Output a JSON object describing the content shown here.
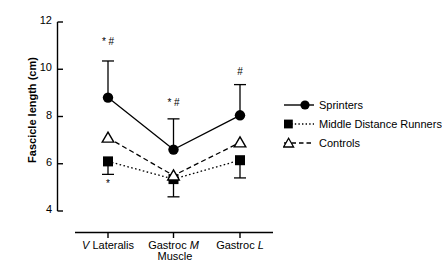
{
  "chart_data": {
    "type": "line",
    "title": "",
    "xlabel": "Muscle",
    "ylabel": "Fascicle length (cm)",
    "categories": [
      "V Lateralis",
      "Gastroc M",
      "Gastroc L"
    ],
    "category_labels_html": [
      "<em>V</em> Lateralis",
      "Gastroc <em>M</em>",
      "Gastroc <em>L</em>"
    ],
    "ylim": [
      4,
      12
    ],
    "yticks": [
      4,
      6,
      8,
      10,
      12
    ],
    "ytick_labels": [
      "4",
      "6",
      "8",
      "10",
      "12"
    ],
    "grid": false,
    "legend_position": "right",
    "series": [
      {
        "name": "Sprinters",
        "marker": "filled-circle",
        "line": "solid",
        "values": [
          8.8,
          6.6,
          8.05
        ],
        "err_upper": [
          1.55,
          1.3,
          1.3
        ],
        "err_lower": [
          0,
          0,
          0
        ]
      },
      {
        "name": "Middle Distance Runners",
        "marker": "filled-square",
        "line": "dotted",
        "values": [
          6.1,
          5.35,
          6.15
        ],
        "err_upper": [
          0,
          0,
          0
        ],
        "err_lower": [
          0.55,
          0.75,
          0.75
        ]
      },
      {
        "name": "Controls",
        "marker": "open-triangle",
        "line": "dashed",
        "values": [
          7.1,
          5.5,
          6.9
        ],
        "err_upper": [
          0,
          0,
          0
        ],
        "err_lower": [
          0,
          0,
          0
        ]
      }
    ],
    "annotations": [
      {
        "text": "* #",
        "category": "V Lateralis",
        "series": "Sprinters",
        "value": 11.1
      },
      {
        "text": "*",
        "category": "V Lateralis",
        "series": "Middle Distance Runners",
        "value": 5.1
      },
      {
        "text": "* #",
        "category": "Gastroc M",
        "series": "Sprinters",
        "value": 8.55
      },
      {
        "text": "#",
        "category": "Gastroc L",
        "series": "Sprinters",
        "value": 9.85
      }
    ]
  },
  "legend": {
    "items": [
      {
        "label": "Sprinters"
      },
      {
        "label": "Middle Distance Runners"
      },
      {
        "label": "Controls"
      }
    ]
  }
}
